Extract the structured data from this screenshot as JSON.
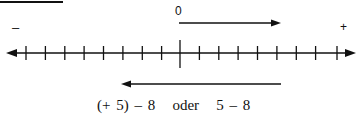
{
  "diagram": {
    "type": "number_line",
    "labels": {
      "zero": "0",
      "negative_sign": "–",
      "positive_sign": "+"
    },
    "tick_count": 17,
    "zero_tick_index": 8,
    "arrows": [
      {
        "name": "start-arrow",
        "from": 0,
        "to": 5,
        "direction": "right"
      },
      {
        "name": "subtract-arrow",
        "from": 5,
        "to": -3,
        "direction": "left"
      }
    ],
    "expression": "(+ 5) – 8   oder   5 – 8"
  }
}
